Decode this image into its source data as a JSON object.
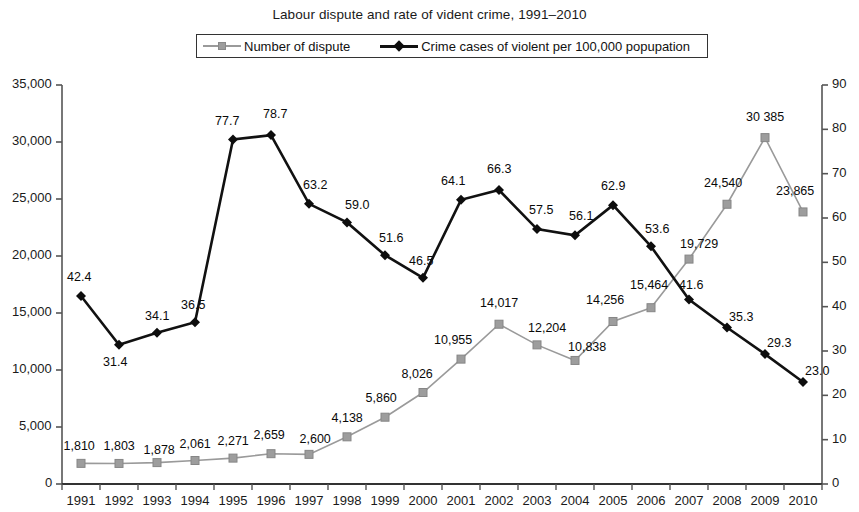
{
  "chart_data": {
    "type": "line",
    "title": "Labour dispute and rate of vident crime, 1991–2010",
    "xlabel": "",
    "ylabel": "",
    "categories": [
      "1991",
      "1992",
      "1993",
      "1994",
      "1995",
      "1996",
      "1997",
      "1998",
      "1999",
      "2000",
      "2001",
      "2002",
      "2003",
      "2004",
      "2005",
      "2006",
      "2007",
      "2008",
      "2009",
      "2010"
    ],
    "grid": false,
    "legend_position": "top-center",
    "axes": {
      "left": {
        "ylim": [
          0,
          35000
        ],
        "ticks": [
          "0",
          "5,000",
          "10,000",
          "15,000",
          "20,000",
          "25,000",
          "30,000",
          "35,000"
        ],
        "tick_values": [
          0,
          5000,
          10000,
          15000,
          20000,
          25000,
          30000,
          35000
        ]
      },
      "right": {
        "ylim": [
          0,
          90
        ],
        "ticks": [
          "0",
          "10",
          "20",
          "30",
          "40",
          "50",
          "60",
          "70",
          "80",
          "90"
        ],
        "tick_values": [
          0,
          10,
          20,
          30,
          40,
          50,
          60,
          70,
          80,
          90
        ]
      }
    },
    "series": [
      {
        "name": "Number of dispute",
        "axis": "left",
        "color": "#9a9a9a",
        "marker": "square",
        "values": [
          1810,
          1803,
          1878,
          2061,
          2271,
          2659,
          2600,
          4138,
          5860,
          8026,
          10955,
          14017,
          12204,
          10838,
          14256,
          15464,
          19729,
          24540,
          30385,
          23865
        ],
        "labels": [
          "1,810",
          "1,803",
          "1,878",
          "2,061",
          "2,271",
          "2,659",
          "2,600",
          "4,138",
          "5,860",
          "8,026",
          "10,955",
          "14,017",
          "12,204",
          "10,838",
          "14,256",
          "15,464",
          "19,729",
          "24,540",
          "30 385",
          "23,865"
        ]
      },
      {
        "name": "Crime cases of violent per 100,000 popupation",
        "axis": "right",
        "color": "#111111",
        "marker": "diamond",
        "values": [
          42.4,
          31.4,
          34.1,
          36.5,
          77.7,
          78.7,
          63.2,
          59.0,
          51.6,
          46.5,
          64.1,
          66.3,
          57.5,
          56.1,
          62.9,
          53.6,
          41.6,
          35.3,
          29.3,
          23.0
        ],
        "labels": [
          "42.4",
          "31.4",
          "34.1",
          "36.5",
          "77.7",
          "78.7",
          "63.2",
          "59.0",
          "51.6",
          "46.5",
          "64.1",
          "66.3",
          "57.5",
          "56.1",
          "62.9",
          "53.6",
          "41.6",
          "35.3",
          "29.3",
          "23.0"
        ]
      }
    ]
  },
  "legend": {
    "entries": [
      {
        "label": "Number of dispute"
      },
      {
        "label": "Crime cases of violent per 100,000 popupation"
      }
    ]
  }
}
